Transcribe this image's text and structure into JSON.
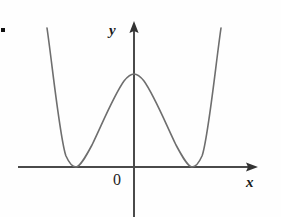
{
  "figure": {
    "name": "quartic-w-curve-graph",
    "background_color": "#fefefe",
    "width": 281,
    "height": 217,
    "corner_mark": {
      "name": "corner-artifact",
      "color": "#111111",
      "x": 1,
      "y": 28,
      "size": 4
    }
  },
  "labels": {
    "y_axis": "y",
    "x_axis": "x",
    "origin": "0"
  },
  "colors": {
    "axis": "#444444",
    "curve": "#6e6e6e",
    "text": "#1a1a1a"
  },
  "chart_data": {
    "type": "line",
    "title": "",
    "xlabel": "x",
    "ylabel": "y",
    "grid": false,
    "legend": null,
    "annotations": [
      "0"
    ],
    "axes": {
      "x_axis": {
        "y_pixel": 167,
        "x_start": 18,
        "x_end": 258,
        "arrow": "right"
      },
      "y_axis": {
        "x_pixel": 134,
        "y_top": 22,
        "y_bottom": 217,
        "arrow": "up"
      }
    },
    "features": {
      "left_minimum": {
        "x": -1.0,
        "y": 0.0,
        "pixel": [
          76,
          167
        ]
      },
      "local_maximum": {
        "x": 0.0,
        "y": 1.0,
        "pixel": [
          134,
          74
        ]
      },
      "right_minimum": {
        "x": 1.0,
        "y": 0.0,
        "pixel": [
          192,
          167
        ]
      }
    },
    "x": [
      -1.52,
      -1.4,
      -1.3,
      -1.2,
      -1.1,
      -1.0,
      -0.9,
      -0.8,
      -0.7,
      -0.6,
      -0.5,
      -0.4,
      -0.3,
      -0.2,
      -0.1,
      0.0,
      0.1,
      0.2,
      0.3,
      0.4,
      0.5,
      0.6,
      0.7,
      0.8,
      0.9,
      1.0,
      1.1,
      1.2,
      1.3,
      1.4,
      1.52
    ],
    "y": [
      1.49,
      0.92,
      0.6,
      0.35,
      0.17,
      0.0,
      0.17,
      0.35,
      0.51,
      0.66,
      0.79,
      0.89,
      0.95,
      0.99,
      1.0,
      1.0,
      1.0,
      0.99,
      0.95,
      0.89,
      0.79,
      0.66,
      0.51,
      0.35,
      0.17,
      0.0,
      0.17,
      0.35,
      0.6,
      0.92,
      1.49
    ],
    "xlim": [
      -2.0,
      2.14
    ],
    "ylim": [
      -0.86,
      1.53
    ],
    "series": [
      {
        "name": "y = (x^2 - 1)^2",
        "color": "#6e6e6e",
        "pixel_path": "M 47,28 C 52,62 60,140 66,156 C 70,165 74,167 76,167 C 80,167 85,158 92,145 C 103,122 114,95 124,81 C 128,76 131,74 134,74 C 137,74 140,76 144,81 C 154,95 165,122 176,145 C 183,158 188,167 192,167 C 194,167 198,165 202,156 C 208,140 216,62 221,28"
      }
    ]
  }
}
